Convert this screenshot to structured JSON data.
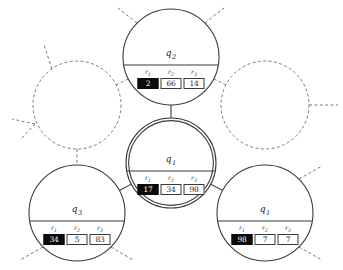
{
  "figure": {
    "background_color": "#ffffff",
    "width": 343,
    "height": 270,
    "solid_stroke_color": "#3a3a3a",
    "dashed_stroke_color": "#6b6b6b",
    "highlight_cell_color": "#0b0b0b",
    "register_headers": [
      "r1",
      "r2",
      "r3"
    ]
  },
  "nodes": {
    "top": {
      "id": "node-top",
      "label": "q",
      "label_sub": "2",
      "cx": 171,
      "cy": 57,
      "r": 48,
      "style": "solid",
      "registers": [
        {
          "name": "r1",
          "sub": "1",
          "value": "2",
          "filled": true
        },
        {
          "name": "r2",
          "sub": "2",
          "value": "66",
          "filled": false
        },
        {
          "name": "r3",
          "sub": "3",
          "value": "14",
          "filled": false
        }
      ]
    },
    "center": {
      "id": "node-center",
      "label": "q",
      "label_sub": "1",
      "cx": 171,
      "cy": 163,
      "r": 45,
      "style": "double",
      "registers": [
        {
          "name": "r1",
          "sub": "1",
          "value": "17",
          "filled": true
        },
        {
          "name": "r2",
          "sub": "2",
          "value": "34",
          "filled": false
        },
        {
          "name": "r3",
          "sub": "3",
          "value": "98",
          "filled": false
        }
      ]
    },
    "bottom_left": {
      "id": "node-bottom-left",
      "label": "q",
      "label_sub": "3",
      "cx": 77,
      "cy": 213,
      "r": 48,
      "style": "solid",
      "registers": [
        {
          "name": "r1",
          "sub": "1",
          "value": "34",
          "filled": true
        },
        {
          "name": "r2",
          "sub": "2",
          "value": "5",
          "filled": false
        },
        {
          "name": "r3",
          "sub": "3",
          "value": "83",
          "filled": false
        }
      ]
    },
    "bottom_right": {
      "id": "node-bottom-right",
      "label": "q",
      "label_sub": "1",
      "cx": 265,
      "cy": 213,
      "r": 48,
      "style": "solid",
      "registers": [
        {
          "name": "r1",
          "sub": "1",
          "value": "98",
          "filled": true
        },
        {
          "name": "r2",
          "sub": "2",
          "value": "7",
          "filled": false
        },
        {
          "name": "r3",
          "sub": "3",
          "value": "7",
          "filled": false
        }
      ]
    },
    "ghost_left": {
      "id": "node-ghost-left",
      "label": "",
      "cx": 77,
      "cy": 105,
      "r": 44,
      "style": "dashed",
      "registers": []
    },
    "ghost_right": {
      "id": "node-ghost-right",
      "label": "",
      "cx": 265,
      "cy": 105,
      "r": 44,
      "style": "dashed",
      "registers": []
    }
  },
  "edges": [
    {
      "id": "edge-top-center",
      "from": "top",
      "to": "center",
      "style": "solid"
    },
    {
      "id": "edge-center-bottom-left",
      "from": "center",
      "to": "bottom_left",
      "style": "solid"
    },
    {
      "id": "edge-center-bottom-right",
      "from": "center",
      "to": "bottom_right",
      "style": "solid"
    },
    {
      "id": "edge-ghost-left-bottom-left",
      "from": "ghost_left",
      "to": "bottom_left",
      "style": "dashed"
    },
    {
      "id": "edge-top-ghost-left",
      "from": "top",
      "to": "ghost_left",
      "style": "dashed"
    },
    {
      "id": "edge-top-ghost-right",
      "from": "top",
      "to": "ghost_right",
      "style": "dashed"
    }
  ],
  "stubs": [
    {
      "id": "stub-top-upleft",
      "x1": 137,
      "y1": 23,
      "x2": 118,
      "y2": 8
    },
    {
      "id": "stub-top-upright",
      "x1": 205,
      "y1": 23,
      "x2": 224,
      "y2": 8
    },
    {
      "id": "stub-ghost-left-up",
      "x1": 52,
      "y1": 69,
      "x2": 44,
      "y2": 45
    },
    {
      "id": "stub-ghost-left-left",
      "x1": 35,
      "y1": 124,
      "x2": 12,
      "y2": 119
    },
    {
      "id": "stub-ghost-left-downleft",
      "x1": 35,
      "y1": 124,
      "x2": 20,
      "y2": 140
    },
    {
      "id": "stub-ghost-right-right",
      "x1": 309,
      "y1": 105,
      "x2": 338,
      "y2": 105
    },
    {
      "id": "stub-bottom-left-downleft",
      "x1": 43,
      "y1": 247,
      "x2": 20,
      "y2": 260
    },
    {
      "id": "stub-bottom-left-downright",
      "x1": 111,
      "y1": 247,
      "x2": 133,
      "y2": 260
    },
    {
      "id": "stub-bottom-right-upright",
      "x1": 299,
      "y1": 179,
      "x2": 322,
      "y2": 166
    },
    {
      "id": "stub-bottom-right-downright",
      "x1": 299,
      "y1": 247,
      "x2": 322,
      "y2": 260
    }
  ]
}
